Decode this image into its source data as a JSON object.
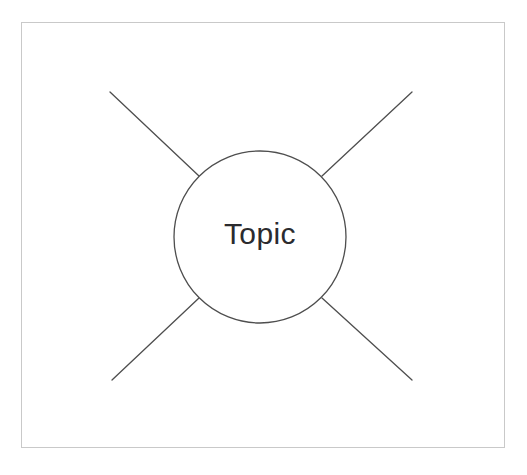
{
  "diagram": {
    "kind": "mind-map",
    "title": "",
    "frame": {
      "border_color": "#c9c9c9",
      "background_color": "#ffffff"
    },
    "center_node": {
      "label": "Topic",
      "shape": "circle",
      "text_color": "#2b2b2e",
      "stroke_color": "#4e4e4e",
      "fill_color": "#ffffff",
      "center_x": 260,
      "center_y": 237,
      "radius": 86
    },
    "branches": [
      {
        "name": "branch-top-left",
        "label": "",
        "direction": "top-left",
        "angle_deg": 218,
        "outer_x": 110,
        "outer_y": 92,
        "stroke_color": "#4e4e4e"
      },
      {
        "name": "branch-top-right",
        "label": "",
        "direction": "top-right",
        "angle_deg": 322,
        "outer_x": 412,
        "outer_y": 92,
        "stroke_color": "#4e4e4e"
      },
      {
        "name": "branch-bottom-left",
        "label": "",
        "direction": "bottom-left",
        "angle_deg": 142,
        "outer_x": 112,
        "outer_y": 380,
        "stroke_color": "#4e4e4e"
      },
      {
        "name": "branch-bottom-right",
        "label": "",
        "direction": "bottom-right",
        "angle_deg": 38,
        "outer_x": 412,
        "outer_y": 380,
        "stroke_color": "#4e4e4e"
      }
    ]
  }
}
